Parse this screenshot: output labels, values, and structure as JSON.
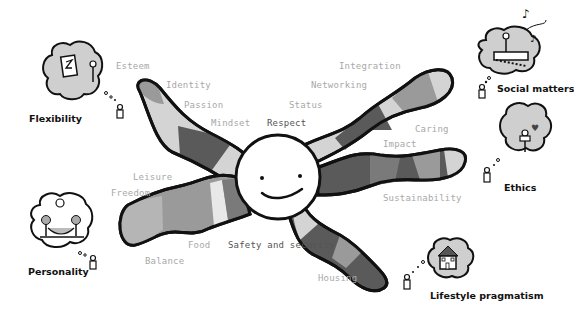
{
  "diagram": {
    "type": "mind-map",
    "center": {
      "shape": "smiling-face"
    },
    "arms": [
      {
        "id": "upper-left",
        "labels": [
          "Esteem",
          "Identity",
          "Passion",
          "Mindset"
        ]
      },
      {
        "id": "upper-right",
        "labels": [
          "Respect",
          "Status",
          "Networking",
          "Integration"
        ]
      },
      {
        "id": "right",
        "labels": [
          "Caring",
          "Impact",
          "Sustainability"
        ]
      },
      {
        "id": "lower-right",
        "labels": [
          "Safety and security",
          "Housing"
        ]
      },
      {
        "id": "left",
        "labels": [
          "Leisure",
          "Freedom",
          "Food",
          "Balance"
        ]
      }
    ],
    "value_labels": {
      "esteem": "Esteem",
      "identity": "Identity",
      "passion": "Passion",
      "mindset": "Mindset",
      "respect": "Respect",
      "status": "Status",
      "networking": "Networking",
      "integration": "Integration",
      "caring": "Caring",
      "impact": "Impact",
      "sustainability": "Sustainability",
      "leisure": "Leisure",
      "freedom": "Freedom",
      "food": "Food",
      "balance": "Balance",
      "safety": "Safety and security",
      "housing": "Housing"
    },
    "categories": {
      "flexibility": "Flexibility",
      "social": "Social matters",
      "ethics": "Ethics",
      "personality": "Personality",
      "lifestyle": "Lifestyle pragmatism"
    },
    "colors": {
      "outline": "#111111",
      "light": "#d4d4d4",
      "mid": "#9a9a9a",
      "dark": "#5a5a5a",
      "label": "#a8a8a8",
      "cloud": "#cfcfcf"
    }
  }
}
